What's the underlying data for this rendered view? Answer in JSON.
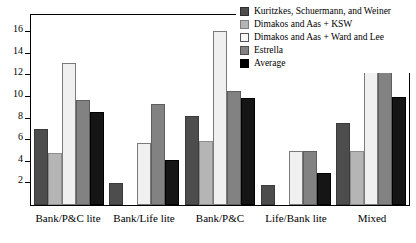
{
  "chart_data": {
    "type": "bar",
    "title": "",
    "subtitle": "",
    "xlabel": "",
    "ylabel": "",
    "ylim": [
      0,
      17.6
    ],
    "grid": false,
    "legend_position": "top-right",
    "ytick_labels": [
      "2",
      "4",
      "6",
      "8",
      "10",
      "12",
      "14",
      "16"
    ],
    "ytick_values": [
      2,
      4,
      6,
      8,
      10,
      12,
      14,
      16
    ],
    "categories": [
      "Bank/P&C lite",
      "Bank/Life lite",
      "Bank/P&C",
      "Life/Bank lite",
      "Mixed"
    ],
    "series": [
      {
        "name": "Kuritzkes, Schuermann, and Weiner",
        "color": "#4d4d4d",
        "values": [
          7.0,
          2.0,
          8.2,
          1.9,
          7.6
        ]
      },
      {
        "name": "Dimakos and Aas + KSW",
        "color": "#b5b5b5",
        "values": [
          4.8,
          0,
          5.9,
          0,
          5.0
        ]
      },
      {
        "name": "Dimakos and Aas + Ward and Lee",
        "color": "#f0f0f0",
        "values": [
          13.2,
          5.7,
          16.1,
          5.0,
          14.2
        ]
      },
      {
        "name": "Estrella",
        "color": "#828282",
        "values": [
          9.7,
          9.4,
          10.6,
          5.0,
          12.4
        ]
      },
      {
        "name": "Average",
        "color": "#151515",
        "values": [
          8.6,
          4.2,
          9.9,
          3.0,
          10.0
        ]
      }
    ]
  }
}
